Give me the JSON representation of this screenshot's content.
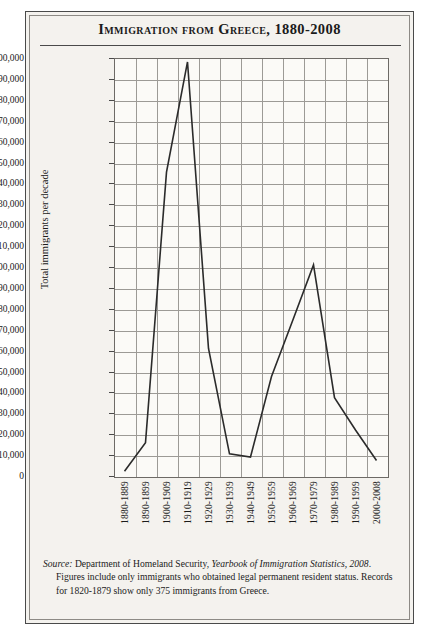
{
  "figure": {
    "title": "Immigration from Greece, 1880-2008",
    "y_axis_title": "Total immigrants per decade",
    "source_prefix": "Source:",
    "source_text_1": " Department of Homeland Security, ",
    "source_italic_1": "Yearbook of Immigration Statistics,",
    "source_italic_2": "2008",
    "source_text_2": ". Figures include only immigrants who obtained legal permanent resident status. Records for 1820-1879 show only 375 immigrants from Greece."
  },
  "colors": {
    "paper": "#f4f2ee",
    "plot_background": "#fbfaf7",
    "frame": "#4a4a4a",
    "inner_frame": "#8d8a85",
    "grid": "#9c9a96",
    "series_line": "#2b2b2b",
    "text": "#1b1b1b"
  },
  "chart_data": {
    "type": "line",
    "title": "Immigration from Greece, 1880-2008",
    "xlabel": "",
    "ylabel": "Total immigrants per decade",
    "ylim": [
      0,
      200000
    ],
    "ytick_step": 10000,
    "grid": true,
    "legend": "none",
    "categories": [
      "1880-1889",
      "1890-1899",
      "1900-1909",
      "1910-1919",
      "1920-1929",
      "1930-1939",
      "1940-1949",
      "1950-1959",
      "1960-1969",
      "1970-1979",
      "1980-1989",
      "1990-1999",
      "2000-2008"
    ],
    "values": [
      2300,
      15980,
      145400,
      198100,
      61000,
      10600,
      9100,
      47600,
      74200,
      101000,
      37500,
      22000,
      7400
    ],
    "ytick_labels": [
      "200,000",
      "190,000",
      "180,000",
      "170,000",
      "160,000",
      "150,000",
      "140,000",
      "130,000",
      "120,000",
      "110,000",
      "100,000",
      "90,000",
      "80,000",
      "70,000",
      "60,000",
      "50,000",
      "40,000",
      "30,000",
      "20,000",
      "10,000",
      "0"
    ],
    "ytick_values": [
      200000,
      190000,
      180000,
      170000,
      160000,
      150000,
      140000,
      130000,
      120000,
      110000,
      100000,
      90000,
      80000,
      70000,
      60000,
      50000,
      40000,
      30000,
      20000,
      10000,
      0
    ]
  }
}
